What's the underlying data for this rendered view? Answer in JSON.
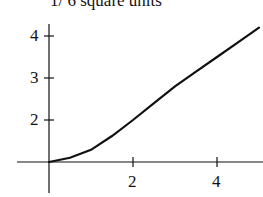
{
  "caption": "1/ 6 square units",
  "chart_data": {
    "type": "line",
    "title": "",
    "xlabel": "",
    "ylabel": "",
    "x_ticks": [
      2,
      4
    ],
    "y_ticks": [
      2,
      3,
      4
    ],
    "x_axis_crosses_y_at": 1,
    "xlim": [
      -0.75,
      5.1
    ],
    "ylim": [
      0.2,
      4.5
    ],
    "grid": false,
    "series": [
      {
        "name": "curve",
        "x": [
          0,
          0.5,
          1,
          1.5,
          2,
          2.5,
          3,
          3.5,
          4,
          4.5,
          5
        ],
        "y": [
          1.0,
          1.1,
          1.29,
          1.62,
          2.0,
          2.4,
          2.8,
          3.15,
          3.5,
          3.85,
          4.2
        ]
      }
    ]
  }
}
